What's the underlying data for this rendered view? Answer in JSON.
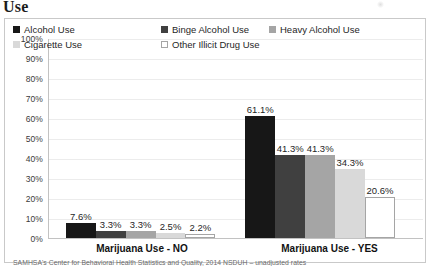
{
  "title_fragment": "Use",
  "footnote": "SAMHSA's Center for Behavioral Health Statistics and Quality, 2014 NSDUH – unadjusted rates",
  "colors": {
    "series_1": "#171717",
    "series_2": "#404040",
    "series_3": "#a5a5a5",
    "series_4": "#d9d9d9",
    "series_5": "#ffffff",
    "series_5_border": "#a5a5a5",
    "gridline": "#ececec",
    "axis": "#c2c2c2",
    "frame": "#c9c9c9",
    "text": "#1f1f1f"
  },
  "chart_data": {
    "type": "bar",
    "title": "Use",
    "xlabel": "",
    "ylabel": "",
    "ylim": [
      0,
      100
    ],
    "grid": true,
    "legend_position": "top-inside",
    "categories": [
      "Marijuana Use - NO",
      "Marijuana Use - YES"
    ],
    "ytick_labels": [
      "100%",
      "90%",
      "80%",
      "70%",
      "60%",
      "50%",
      "40%",
      "30%",
      "20%",
      "10%",
      "0%"
    ],
    "ytick_values": [
      100,
      90,
      80,
      70,
      60,
      50,
      40,
      30,
      20,
      10,
      0
    ],
    "series": [
      {
        "name": "Alcohol Use",
        "values": [
          7.6,
          61.1
        ],
        "labels": [
          "7.6%",
          "61.1%"
        ],
        "color": "#171717"
      },
      {
        "name": "Binge Alcohol Use",
        "values": [
          3.3,
          41.3
        ],
        "labels": [
          "3.3%",
          "41.3%"
        ],
        "color": "#404040"
      },
      {
        "name": "Heavy Alcohol Use",
        "values": [
          3.3,
          41.3
        ],
        "labels": [
          "3.3%",
          "41.3%"
        ],
        "color": "#a5a5a5"
      },
      {
        "name": "Cigarette Use",
        "values": [
          2.5,
          34.3
        ],
        "labels": [
          "2.5%",
          "34.3%"
        ],
        "color": "#d9d9d9"
      },
      {
        "name": "Other Illicit Drug Use",
        "values": [
          2.2,
          20.6
        ],
        "labels": [
          "2.2%",
          "20.6%"
        ],
        "color": "#ffffff"
      }
    ],
    "annotations": [
      "SAMHSA's Center for Behavioral Health Statistics and Quality, 2014 NSDUH – unadjusted rates"
    ]
  }
}
